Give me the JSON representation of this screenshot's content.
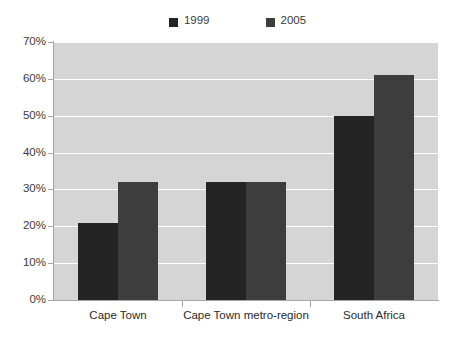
{
  "chart_data": {
    "type": "bar",
    "title": "",
    "xlabel": "",
    "ylabel": "",
    "categories": [
      "Cape Town",
      "Cape Town metro-region",
      "South Africa"
    ],
    "series": [
      {
        "name": "1999",
        "color": "#242424",
        "values": [
          21,
          32,
          50
        ]
      },
      {
        "name": "2005",
        "color": "#3d3d3d",
        "values": [
          32,
          32,
          61
        ]
      }
    ],
    "ylim": [
      0,
      70
    ],
    "ytick_step": 10,
    "ytick_labels": [
      "70%",
      "60%",
      "50%",
      "40%",
      "30%",
      "20%",
      "10%",
      "0%"
    ],
    "ytick_values": [
      70,
      60,
      50,
      40,
      30,
      20,
      10,
      0
    ],
    "grid": true,
    "grid_color": "#ffffff",
    "plot_background": "#d5d5d5",
    "axis_color": "#a6a6a6",
    "legend_position": "top-center"
  },
  "legend": {
    "entries": [
      {
        "label": "1999",
        "color": "#242424"
      },
      {
        "label": "2005",
        "color": "#3d3d3d"
      }
    ]
  }
}
